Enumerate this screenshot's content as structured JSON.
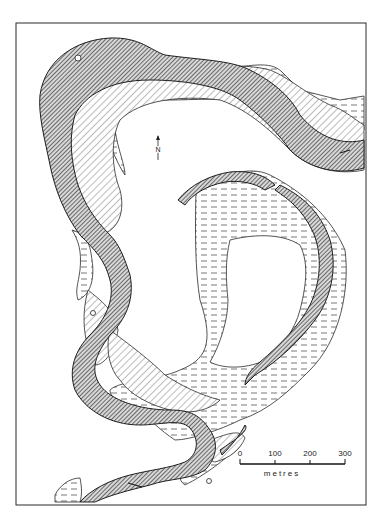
{
  "map": {
    "north_arrow": {
      "label": "N"
    },
    "scale_bar": {
      "ticks": [
        "0",
        "100",
        "200",
        "300"
      ],
      "unit": "metres"
    },
    "channel_markers": [
      {
        "id": "marker-1",
        "glyph": "o"
      },
      {
        "id": "marker-2",
        "glyph": "•"
      },
      {
        "id": "marker-3",
        "glyph": "•"
      }
    ],
    "colors": {
      "ink": "#2a2a2a",
      "background": "#ffffff",
      "channel_hatch": "#3a3a3a",
      "bar_hatch": "#555555",
      "floodplain_dash": "#555555"
    }
  }
}
